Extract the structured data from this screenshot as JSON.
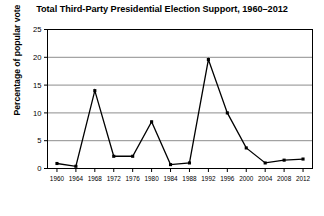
{
  "chart_data": {
    "type": "line",
    "title": "Total Third-Party Presidential Election Support, 1960–2012",
    "xlabel": "",
    "ylabel": "Percentage of popular vote",
    "categories": [
      1960,
      1964,
      1968,
      1972,
      1976,
      1980,
      1984,
      1988,
      1992,
      1996,
      2000,
      2004,
      2008,
      2012
    ],
    "values": [
      0.9,
      0.4,
      14.0,
      2.2,
      2.2,
      8.4,
      0.7,
      1.0,
      19.6,
      10.0,
      3.7,
      1.0,
      1.5,
      1.7
    ],
    "x_tick_labels": [
      "1960",
      "1964",
      "1968",
      "1972",
      "1976",
      "1980",
      "1984",
      "1988",
      "1992",
      "1996",
      "2000",
      "2004",
      "2008",
      "2012"
    ],
    "y_tick_labels": [
      "0",
      "5",
      "10",
      "15",
      "20",
      "25"
    ],
    "y_ticks": [
      0,
      5,
      10,
      15,
      20,
      25
    ],
    "ylim": [
      0,
      25
    ],
    "grid": "horizontal",
    "legend": "none",
    "series_color": "#000000",
    "grid_color": "#808080",
    "marker": "square"
  }
}
